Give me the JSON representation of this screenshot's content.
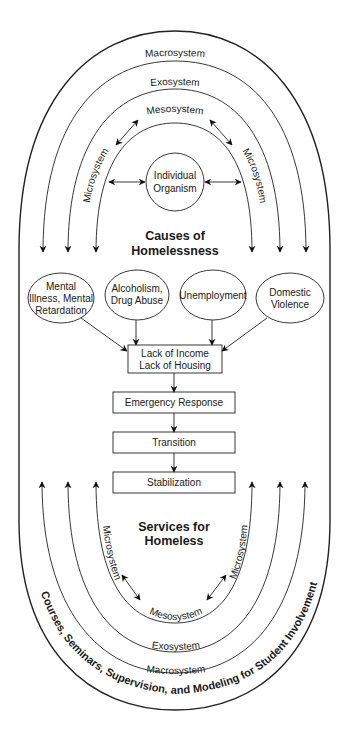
{
  "diagram": {
    "top_section": {
      "title_line1": "Causes of",
      "title_line2": "Homelessness",
      "center_node": {
        "line1": "Individual",
        "line2": "Organism"
      },
      "rings": {
        "macro": "Macrosystem",
        "exo": "Exosystem",
        "meso": "Mesosystem",
        "micro_left": "Microsystem",
        "micro_right": "Microsystem"
      }
    },
    "causes": [
      {
        "lines": [
          "Mental",
          "Illness, Mental",
          "Retardation"
        ]
      },
      {
        "lines": [
          "Alcoholism,",
          "Drug Abuse"
        ]
      },
      {
        "lines": [
          "Unemployment"
        ]
      },
      {
        "lines": [
          "Domestic",
          "Violence"
        ]
      }
    ],
    "flow": [
      {
        "lines": [
          "Lack of Income",
          "Lack of Housing"
        ]
      },
      {
        "lines": [
          "Emergency Response"
        ]
      },
      {
        "lines": [
          "Transition"
        ]
      },
      {
        "lines": [
          "Stabilization"
        ]
      }
    ],
    "bottom_section": {
      "title_line1": "Services for",
      "title_line2": "Homeless",
      "rings": {
        "macro": "Macrosystem",
        "exo": "Exosystem",
        "meso": "Mesosystem",
        "micro_left": "Microsystem",
        "micro_right": "Microsystem"
      }
    },
    "outer_label": "Courses, Seminars, Supervision, and Modeling for Student Involvement"
  }
}
